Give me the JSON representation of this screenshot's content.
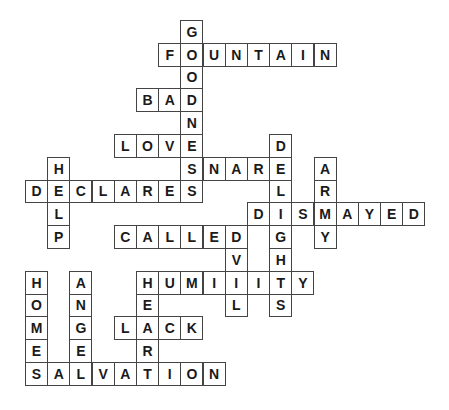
{
  "puzzle": {
    "type": "crossword",
    "grid": {
      "origin_x": 25,
      "origin_y": 20,
      "cell_w": 22.2,
      "cell_h": 22.8
    },
    "words": [
      {
        "word": "GOODNESS",
        "dir": "down",
        "col": 7,
        "row": 0
      },
      {
        "word": "FOUNTAIN",
        "dir": "across",
        "col": 6,
        "row": 1
      },
      {
        "word": "BAD",
        "dir": "across",
        "col": 5,
        "row": 3
      },
      {
        "word": "LOVE",
        "dir": "across",
        "col": 4,
        "row": 5
      },
      {
        "word": "SNARE",
        "dir": "across",
        "col": 7,
        "row": 6
      },
      {
        "word": "DELIGHTS",
        "dir": "down",
        "col": 11,
        "row": 5
      },
      {
        "word": "ARMY",
        "dir": "down",
        "col": 13,
        "row": 6
      },
      {
        "word": "HELP",
        "dir": "down",
        "col": 1,
        "row": 6
      },
      {
        "word": "DECLARES",
        "dir": "across",
        "col": 0,
        "row": 7
      },
      {
        "word": "DISMAYED",
        "dir": "across",
        "col": 10,
        "row": 8
      },
      {
        "word": "CALLED",
        "dir": "across",
        "col": 4,
        "row": 9
      },
      {
        "word": "EVIL",
        "dir": "down",
        "col": 9,
        "row": 9
      },
      {
        "word": "HUMILITY",
        "dir": "across",
        "col": 5,
        "row": 11
      },
      {
        "word": "HEAR",
        "dir": "down",
        "col": 5,
        "row": 11
      },
      {
        "word": "LACK",
        "dir": "across",
        "col": 4,
        "row": 13
      },
      {
        "word": "HOMES",
        "dir": "down",
        "col": 0,
        "row": 11
      },
      {
        "word": "ANGEL",
        "dir": "down",
        "col": 2,
        "row": 11
      },
      {
        "word": "SALVATION",
        "dir": "across",
        "col": 0,
        "row": 15
      }
    ]
  }
}
